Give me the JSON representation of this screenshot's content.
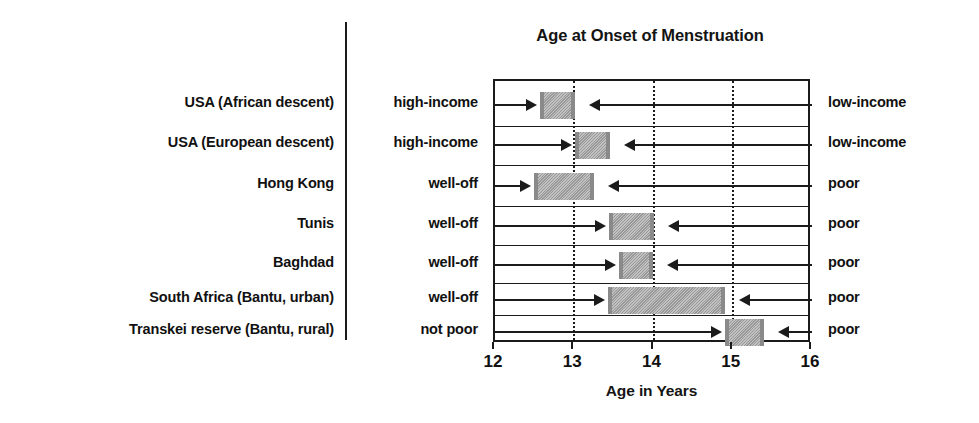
{
  "chart": {
    "title": "Age at Onset of Menstruation",
    "xlabel": "Age in Years",
    "x_ticks": [
      "12",
      "13",
      "14",
      "15",
      "16"
    ]
  },
  "rows": [
    {
      "place": "USA (African descent)",
      "left_status": "high-income",
      "right_status": "low-income",
      "start": 12.57,
      "end": 13.01
    },
    {
      "place": "USA (European descent)",
      "left_status": "high-income",
      "right_status": "low-income",
      "start": 13.01,
      "end": 13.45
    },
    {
      "place": "Hong Kong",
      "left_status": "well-off",
      "right_status": "poor",
      "start": 12.49,
      "end": 13.25
    },
    {
      "place": "Tunis",
      "left_status": "well-off",
      "right_status": "poor",
      "start": 13.44,
      "end": 14.01
    },
    {
      "place": "Baghdad",
      "left_status": "well-off",
      "right_status": "poor",
      "start": 13.56,
      "end": 13.99
    },
    {
      "place": "South Africa (Bantu, urban)",
      "left_status": "well-off",
      "right_status": "poor",
      "start": 13.43,
      "end": 14.9
    },
    {
      "place": "Transkei reserve (Bantu, rural)",
      "left_status": "not poor",
      "right_status": "poor",
      "start": 14.9,
      "end": 15.39
    }
  ],
  "chart_data": {
    "type": "bar",
    "title": "Age at Onset of Menstruation",
    "xlabel": "Age in Years",
    "ylabel": "",
    "orientation": "horizontal",
    "bar_kind": "range",
    "xlim": [
      12,
      16
    ],
    "xticks": [
      12,
      13,
      14,
      15,
      16
    ],
    "gridlines_dotted_at": [
      13,
      14,
      15
    ],
    "grid": true,
    "legend": "none",
    "categories": [
      "USA (African descent)",
      "USA (European descent)",
      "Hong Kong",
      "Tunis",
      "Baghdad",
      "South Africa (Bantu, urban)",
      "Transkei reserve (Bantu, rural)"
    ],
    "series": [
      {
        "name": "Age range at menarche (years)",
        "starts": [
          12.57,
          13.01,
          12.49,
          13.44,
          13.56,
          13.43,
          14.9
        ],
        "ends": [
          13.01,
          13.45,
          13.25,
          14.01,
          13.99,
          14.9,
          15.39
        ]
      }
    ],
    "left_group_labels": [
      "high-income",
      "high-income",
      "well-off",
      "well-off",
      "well-off",
      "well-off",
      "not poor"
    ],
    "right_group_labels": [
      "low-income",
      "low-income",
      "poor",
      "poor",
      "poor",
      "poor",
      "poor"
    ],
    "annotations": [
      "Arrows point inward from the high-income/well-off side (left) and the low-income/poor side (right) toward each shaded age range."
    ]
  }
}
